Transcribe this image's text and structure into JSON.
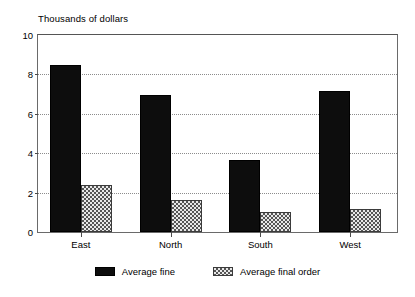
{
  "chart_data": {
    "type": "bar",
    "title": "",
    "ylabel": "Thousands of dollars",
    "xlabel": "",
    "categories": [
      "East",
      "North",
      "South",
      "West"
    ],
    "series": [
      {
        "name": "Average fine",
        "color": "#0d0d0d",
        "values": [
          8.5,
          6.95,
          3.65,
          7.15
        ]
      },
      {
        "name": "Average final order",
        "color": "#a8a8a8",
        "values": [
          2.4,
          1.6,
          1.0,
          1.15
        ]
      }
    ],
    "ylim": [
      0,
      10
    ],
    "yticks": [
      0,
      2,
      4,
      6,
      8,
      10
    ],
    "ytick_labels": [
      "0",
      "2",
      "4",
      "6",
      "8",
      "10"
    ],
    "grid": "horizontal-dotted",
    "legend_position": "bottom-center"
  },
  "legend": {
    "entries": [
      {
        "label": "Average fine"
      },
      {
        "label": "Average final order"
      }
    ]
  }
}
